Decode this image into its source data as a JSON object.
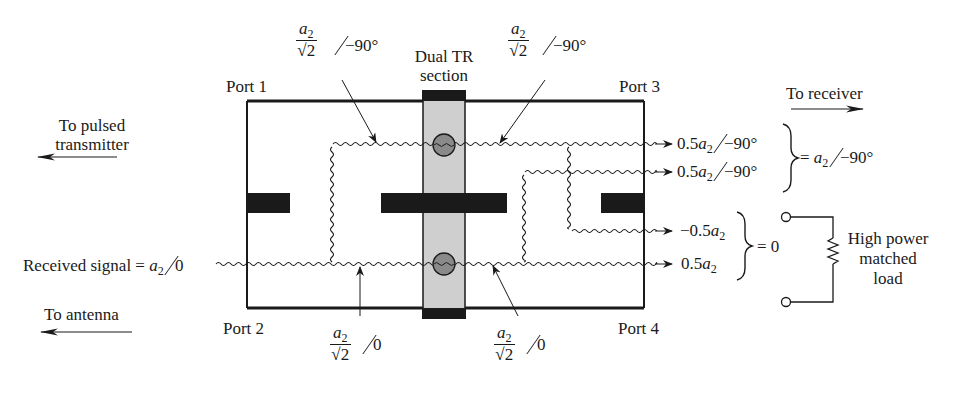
{
  "diagram": {
    "ports": {
      "port1": "Port 1",
      "port2": "Port 2",
      "port3": "Port 3",
      "port4": "Port 4"
    },
    "tr_section": {
      "line1": "Dual TR",
      "line2": "section"
    },
    "directions": {
      "transmitter_line1": "To pulsed",
      "transmitter_line2": "transmitter",
      "antenna": "To antenna",
      "receiver": "To receiver"
    },
    "input": {
      "label": "Received signal = ",
      "var": "a",
      "sub": "2",
      "angle": "0"
    },
    "branch_annotations": {
      "top_left": {
        "num_var": "a",
        "num_sub": "2",
        "den": "√2",
        "angle": "−90°"
      },
      "top_right": {
        "num_var": "a",
        "num_sub": "2",
        "den": "√2",
        "angle": "−90°"
      },
      "bottom_left": {
        "num_var": "a",
        "num_sub": "2",
        "den": "√2",
        "angle": "0"
      },
      "bottom_right": {
        "num_var": "a",
        "num_sub": "2",
        "den": "√2",
        "angle": "0"
      }
    },
    "outputs": [
      {
        "coef": "0.5",
        "var": "a",
        "sub": "2",
        "angle": "−90°"
      },
      {
        "coef": "0.5",
        "var": "a",
        "sub": "2",
        "angle": "−90°"
      },
      {
        "coef": "−0.5",
        "var": "a",
        "sub": "2",
        "angle": ""
      },
      {
        "coef": "0.5",
        "var": "a",
        "sub": "2",
        "angle": ""
      }
    ],
    "sums": {
      "receiver_sum_prefix": "= ",
      "receiver_sum_var": "a",
      "receiver_sum_sub": "2",
      "receiver_sum_angle": "−90°",
      "load_sum": "= 0"
    },
    "load": {
      "line1": "High power",
      "line2": "matched",
      "line3": "load"
    },
    "colors": {
      "ink": "#1a1a1a",
      "tr_fill": "#cfcfcf",
      "gas_tube_fill": "#8a8a8a"
    }
  }
}
